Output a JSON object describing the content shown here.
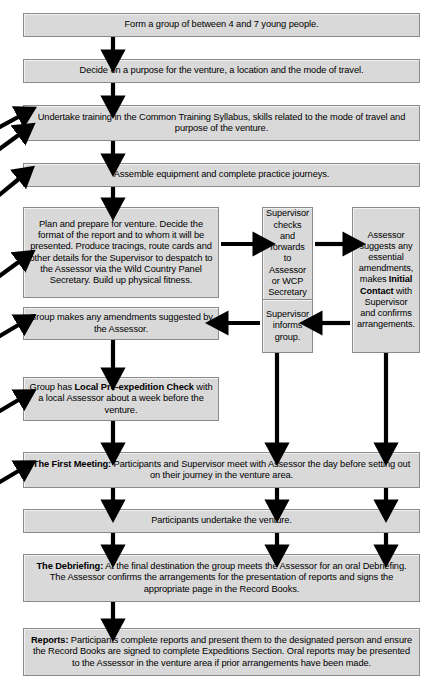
{
  "diagram": {
    "colors": {
      "box_fill": "#d9d9d9",
      "box_border": "#8a8a8a",
      "arrow": "#000000",
      "page_background": "#ffffff"
    },
    "boxes": [
      {
        "id": "form-group",
        "text": "Form a group of between 4 and 7 young people."
      },
      {
        "id": "decide-purpose",
        "text": "Decide on a purpose for the venture, a location and the mode of travel."
      },
      {
        "id": "undertake-training",
        "text": "Undertake training in the Common Training Syllabus, skills related to the mode of travel and purpose of the venture."
      },
      {
        "id": "assemble-equipment",
        "text": "Assemble equipment and complete practice journeys."
      },
      {
        "id": "plan-and-prepare",
        "text": "Plan and prepare for venture. Decide the format of the report and to whom it will be presented. Produce tracings, route cards and other details for the Supervisor to despatch to the Assessor via the Wild Country Panel Secretary. Build up physical fitness."
      },
      {
        "id": "supervisor-checks",
        "text": "Supervisor checks and forwards to Assessor or WCP Secretary if in Wild Country."
      },
      {
        "id": "assessor-suggests",
        "text_before": "Assessor suggests any essential amendments, makes ",
        "text_bold": "Initial Contact",
        "text_after": " with Supervisor and confirms arrangements."
      },
      {
        "id": "group-amendments",
        "text": "Group makes any amendments suggested by the Assessor."
      },
      {
        "id": "supervisor-informs",
        "text": "Supervisor informs group."
      },
      {
        "id": "local-pre-expedition-check",
        "text_before": "Group has ",
        "text_bold": "Local Pre-expedition Check",
        "text_after": " with a local Assessor about a week before the venture."
      },
      {
        "id": "first-meeting",
        "text_bold": "The First Meeting:",
        "text_after": " Participants and Supervisor meet with Assessor the day before setting out on their journey in the venture area."
      },
      {
        "id": "undertake-venture",
        "text": "Participants undertake the venture."
      },
      {
        "id": "debriefing",
        "text_bold": "The Debriefing:",
        "text_after": " At the final destination the group meets the Assessor for an oral Debriefing. The Assessor confirms the arrangements for the presentation of reports and signs the appropriate page in the Record Books."
      },
      {
        "id": "reports",
        "text_bold": "Reports:",
        "text_after": " Participants complete reports and present them to the designated person and ensure the Record Books are signed to complete Expeditions Section. Oral reports may be presented to the Assessor in the venture area if prior arrangements have been made."
      }
    ]
  }
}
